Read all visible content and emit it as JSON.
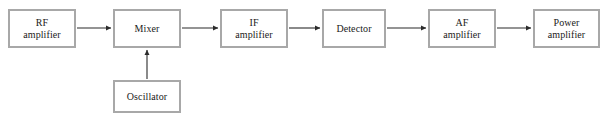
{
  "diagram": {
    "type": "block-diagram",
    "background_color": "#ffffff",
    "block_border_color": "#a8a8a8",
    "block_fill_color": "#ffffff",
    "connector_color": "#2b2b2b",
    "blocks": [
      {
        "id": "rf-amplifier",
        "label": "RF\namplifier",
        "x": 8,
        "y": 9,
        "w": 68,
        "h": 39
      },
      {
        "id": "mixer",
        "label": "Mixer",
        "x": 113,
        "y": 9,
        "w": 68,
        "h": 39
      },
      {
        "id": "if-amplifier",
        "label": "IF\namplifier",
        "x": 220,
        "y": 9,
        "w": 68,
        "h": 39
      },
      {
        "id": "detector",
        "label": "Detector",
        "x": 322,
        "y": 9,
        "w": 64,
        "h": 39
      },
      {
        "id": "af-amplifier",
        "label": "AF\namplifier",
        "x": 428,
        "y": 9,
        "w": 68,
        "h": 39
      },
      {
        "id": "power-amplifier",
        "label": "Power\namplifier",
        "x": 533,
        "y": 9,
        "w": 67,
        "h": 39
      },
      {
        "id": "oscillator",
        "label": "Oscillator",
        "x": 113,
        "y": 80,
        "w": 68,
        "h": 33
      }
    ],
    "connectors": [
      {
        "id": "rf-to-mixer",
        "from": "rf-amplifier",
        "to": "mixer",
        "orientation": "horizontal",
        "x1": 77,
        "y1": 28,
        "x2": 111,
        "y2": 28
      },
      {
        "id": "mixer-to-if",
        "from": "mixer",
        "to": "if-amplifier",
        "orientation": "horizontal",
        "x1": 182,
        "y1": 28,
        "x2": 218,
        "y2": 28
      },
      {
        "id": "if-to-detector",
        "from": "if-amplifier",
        "to": "detector",
        "orientation": "horizontal",
        "x1": 289,
        "y1": 28,
        "x2": 320,
        "y2": 28
      },
      {
        "id": "detector-to-af",
        "from": "detector",
        "to": "af-amplifier",
        "orientation": "horizontal",
        "x1": 387,
        "y1": 28,
        "x2": 426,
        "y2": 28
      },
      {
        "id": "af-to-power",
        "from": "af-amplifier",
        "to": "power-amplifier",
        "orientation": "horizontal",
        "x1": 497,
        "y1": 28,
        "x2": 531,
        "y2": 28
      },
      {
        "id": "oscillator-to-mixer",
        "from": "oscillator",
        "to": "mixer",
        "orientation": "vertical",
        "x1": 147,
        "y1": 79,
        "x2": 147,
        "y2": 50
      }
    ]
  }
}
